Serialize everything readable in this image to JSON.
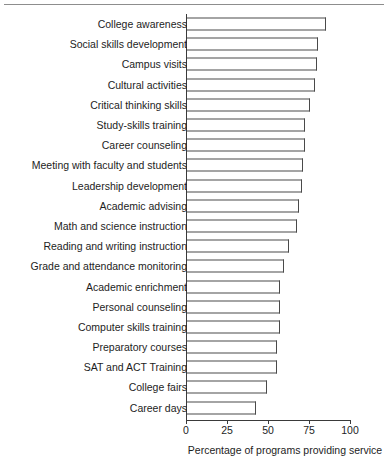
{
  "chart_data": {
    "type": "bar",
    "orientation": "horizontal",
    "title": "",
    "subtitle": "",
    "xlabel": "Percentage of programs providing service",
    "ylabel": "",
    "xlim": [
      0,
      100
    ],
    "xticks": [
      0,
      25,
      50,
      75,
      100
    ],
    "xticklabels": [
      "0",
      "25",
      "50",
      "75",
      "100"
    ],
    "grid": false,
    "legend": null,
    "categories": [
      "College awareness",
      "Social skills development",
      "Campus visits",
      "Cultural activities",
      "Critical thinking skills",
      "Study-skills training",
      "Career counseling",
      "Meeting with faculty and students",
      "Leadership development",
      "Academic advising",
      "Math and science instruction",
      "Reading and writing instruction",
      "Grade and attendance monitoring",
      "Academic enrichment",
      "Personal counseling",
      "Computer skills training",
      "Preparatory courses",
      "SAT and ACT Training",
      "College fairs",
      "Career days"
    ],
    "values": [
      85,
      80,
      79,
      78,
      75,
      72,
      72,
      71,
      70,
      68,
      67,
      62,
      59,
      57,
      57,
      57,
      55,
      55,
      49,
      42
    ],
    "bar_style": {
      "fill": "#ffffff",
      "edge": "#4a4a4a"
    }
  }
}
